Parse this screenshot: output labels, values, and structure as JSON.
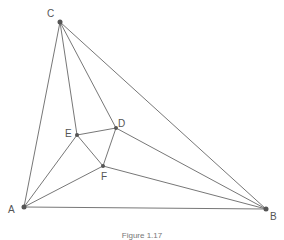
{
  "figure": {
    "caption": "Figure 1.17",
    "points": {
      "A": {
        "label": "A",
        "x": 24,
        "y": 207
      },
      "B": {
        "label": "B",
        "x": 266,
        "y": 209
      },
      "C": {
        "label": "C",
        "x": 60,
        "y": 22
      },
      "D": {
        "label": "D",
        "x": 116,
        "y": 128
      },
      "E": {
        "label": "E",
        "x": 77,
        "y": 135
      },
      "F": {
        "label": "F",
        "x": 103,
        "y": 166
      }
    },
    "segments": [
      [
        "A",
        "B"
      ],
      [
        "B",
        "C"
      ],
      [
        "C",
        "A"
      ],
      [
        "C",
        "E"
      ],
      [
        "C",
        "D"
      ],
      [
        "A",
        "E"
      ],
      [
        "A",
        "F"
      ],
      [
        "B",
        "D"
      ],
      [
        "B",
        "F"
      ],
      [
        "D",
        "E"
      ],
      [
        "D",
        "F"
      ],
      [
        "E",
        "F"
      ]
    ],
    "colors": {
      "line": "#777777",
      "point": "#555555",
      "label": "#555555"
    }
  }
}
